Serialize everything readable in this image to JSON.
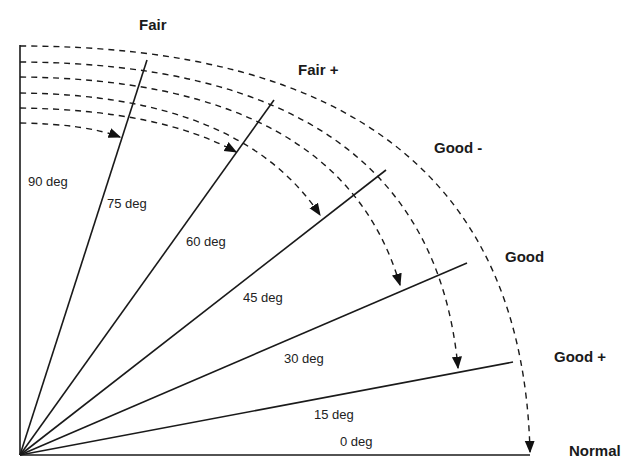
{
  "diagram": {
    "title": "",
    "origin": {
      "x": 20,
      "y": 455
    },
    "rays": [
      {
        "angle": 90,
        "label": "90 deg",
        "length": 410
      },
      {
        "angle": 75,
        "label": "75 deg",
        "length": 408
      },
      {
        "angle": 60,
        "label": "60 deg",
        "length": 442
      },
      {
        "angle": 45,
        "label": "45 deg",
        "length": 482
      },
      {
        "angle": 30,
        "label": "30 deg",
        "length": 514
      },
      {
        "angle": 15,
        "label": "15 deg",
        "length": 508
      },
      {
        "angle": 0,
        "label": "0 deg",
        "length": 510
      }
    ],
    "categories": [
      {
        "label": "Fair"
      },
      {
        "label": "Fair +"
      },
      {
        "label": "Good -"
      },
      {
        "label": "Good"
      },
      {
        "label": "Good +"
      },
      {
        "label": "Normal"
      }
    ],
    "line_color": "#1a1a1a"
  }
}
